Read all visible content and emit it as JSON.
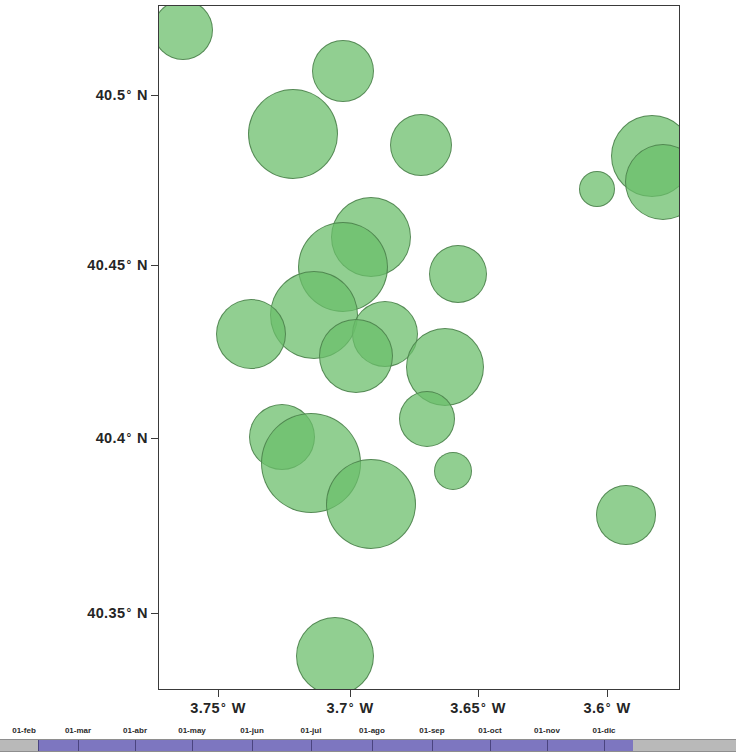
{
  "chart_data": {
    "type": "scatter",
    "title": "",
    "xlabel": "",
    "ylabel": "",
    "subtype": "bubble-map",
    "projection": "geographic",
    "marker_color": "#6BBE6B",
    "marker_edge_color": "#4A7E4A",
    "marker_opacity": 0.74,
    "xlim": [
      -3.775,
      -3.576
    ],
    "ylim": [
      40.3305,
      40.5155
    ],
    "grid": false,
    "legend": null,
    "xaxis": {
      "unit": "degrees West",
      "ticks": [
        {
          "label": "3.75",
          "suffix": "W",
          "value": -3.75,
          "px": 218
        },
        {
          "label": "3.7",
          "suffix": "W",
          "value": -3.7,
          "px": 350
        },
        {
          "label": "3.65",
          "suffix": "W",
          "value": -3.65,
          "px": 478
        },
        {
          "label": "3.6",
          "suffix": "W",
          "value": -3.6,
          "px": 607
        }
      ]
    },
    "yaxis": {
      "unit": "degrees North",
      "ticks": [
        {
          "label": "40.5",
          "suffix": "N",
          "value": 40.5,
          "px": 95
        },
        {
          "label": "40.45",
          "suffix": "N",
          "value": 40.45,
          "px": 265
        },
        {
          "label": "40.4",
          "suffix": "N",
          "value": 40.4,
          "px": 438
        },
        {
          "label": "40.35",
          "suffix": "N",
          "value": 40.35,
          "px": 613
        }
      ]
    },
    "points": [
      {
        "lon": -3.766,
        "lat": 40.509,
        "r": 30
      },
      {
        "lon": -3.705,
        "lat": 40.498,
        "r": 31
      },
      {
        "lon": -3.724,
        "lat": 40.481,
        "r": 45
      },
      {
        "lon": -3.675,
        "lat": 40.478,
        "r": 31
      },
      {
        "lon": -3.587,
        "lat": 40.475,
        "r": 41
      },
      {
        "lon": -3.608,
        "lat": 40.466,
        "r": 18
      },
      {
        "lon": -3.583,
        "lat": 40.468,
        "r": 38
      },
      {
        "lon": -3.694,
        "lat": 40.453,
        "r": 40
      },
      {
        "lon": -3.705,
        "lat": 40.445,
        "r": 45
      },
      {
        "lon": -3.661,
        "lat": 40.443,
        "r": 29
      },
      {
        "lon": -3.716,
        "lat": 40.432,
        "r": 44
      },
      {
        "lon": -3.74,
        "lat": 40.427,
        "r": 35
      },
      {
        "lon": -3.689,
        "lat": 40.427,
        "r": 33
      },
      {
        "lon": -3.7,
        "lat": 40.421,
        "r": 37
      },
      {
        "lon": -3.666,
        "lat": 40.418,
        "r": 39
      },
      {
        "lon": -3.673,
        "lat": 40.404,
        "r": 28
      },
      {
        "lon": -3.728,
        "lat": 40.399,
        "r": 33
      },
      {
        "lon": -3.717,
        "lat": 40.392,
        "r": 50
      },
      {
        "lon": -3.663,
        "lat": 40.39,
        "r": 19
      },
      {
        "lon": -3.694,
        "lat": 40.381,
        "r": 45
      },
      {
        "lon": -3.597,
        "lat": 40.378,
        "r": 30
      },
      {
        "lon": -3.708,
        "lat": 40.34,
        "r": 39
      }
    ]
  },
  "timeline": {
    "labels": [
      {
        "text": "01-feb",
        "px": 24
      },
      {
        "text": "01-mar",
        "px": 78
      },
      {
        "text": "01-abr",
        "px": 135
      },
      {
        "text": "01-may",
        "px": 192
      },
      {
        "text": "01-jun",
        "px": 252
      },
      {
        "text": "01-jul",
        "px": 311
      },
      {
        "text": "01-ago",
        "px": 372
      },
      {
        "text": "01-sep",
        "px": 432
      },
      {
        "text": "01-oct",
        "px": 490
      },
      {
        "text": "01-nov",
        "px": 547
      },
      {
        "text": "01-dic",
        "px": 604
      }
    ],
    "dividers_px": [
      38,
      78,
      135,
      192,
      252,
      311,
      372,
      432,
      490,
      547,
      604
    ],
    "fill_color": "#7D76C0",
    "track_color": "#B9B9B9",
    "fill_start_px": 38,
    "fill_end_px": 633
  }
}
